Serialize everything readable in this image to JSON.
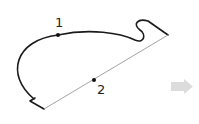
{
  "diagram": {
    "points": [
      {
        "label": "1",
        "x": 58,
        "y": 35
      },
      {
        "label": "2",
        "x": 94,
        "y": 80
      }
    ],
    "colors": {
      "curve": "#1a1a1a",
      "line": "#9a9a9a",
      "arrow": "#d9d9d9"
    }
  },
  "navigation": {
    "next_arrow_icon": "arrow-right-icon"
  }
}
